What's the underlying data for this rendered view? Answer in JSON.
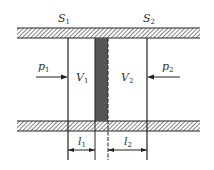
{
  "diagram": {
    "type": "cylinder-piston",
    "labels": {
      "S1": {
        "main": "S",
        "sub": "1"
      },
      "S2": {
        "main": "S",
        "sub": "2"
      },
      "p1": {
        "main": "p",
        "sub": "1"
      },
      "p2": {
        "main": "p",
        "sub": "2"
      },
      "V1": {
        "main": "V",
        "sub": "1"
      },
      "V2": {
        "main": "V",
        "sub": "2"
      },
      "l1": {
        "main": "l",
        "sub": "1"
      },
      "l2": {
        "main": "l",
        "sub": "2"
      }
    },
    "colors": {
      "line": "#222222",
      "piston": "#555555",
      "hatch": "#444444",
      "text": "#333333"
    }
  }
}
